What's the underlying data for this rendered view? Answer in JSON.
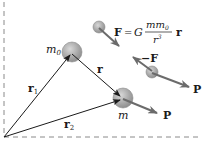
{
  "diagram": {
    "type": "gravitational-two-body-vectors",
    "colors": {
      "line": "#1a1a1a",
      "arrow_gray": "#6b6b6b",
      "sphere_fill": "#a8a8a8",
      "axis_dash": "#8a8a8a"
    },
    "labels": {
      "m0": "m",
      "m0_sub": "0",
      "m": "m",
      "r": "r",
      "r1": "r",
      "r1_sub": "1",
      "r2": "r",
      "r2_sub": "2",
      "force": "F",
      "neg_force": "−F",
      "p_upper": "P",
      "p_lower": "P",
      "equation_lhs": "F",
      "equation_eq": "=",
      "equation_G": "G",
      "equation_num": "mm",
      "equation_num_sub": "0",
      "equation_den": "r",
      "equation_den_sup": "3",
      "equation_vec": "r"
    }
  }
}
